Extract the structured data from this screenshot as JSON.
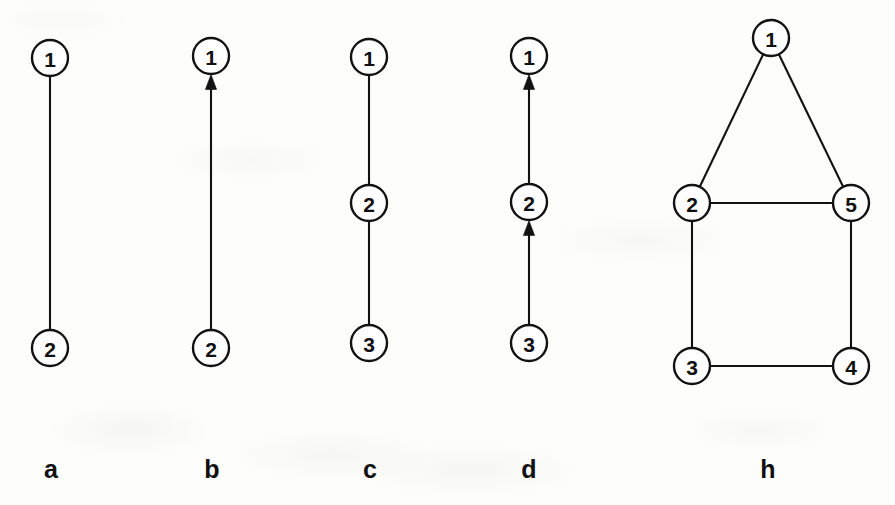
{
  "figure": {
    "width": 895,
    "height": 505,
    "background_color": "#fdfdfc",
    "ink_color": "#121212",
    "node_radius": 18,
    "node_fill": "#ffffff",
    "caption_y": 478
  },
  "panels": [
    {
      "id": "a",
      "caption": "a",
      "caption_x": 51,
      "directed": false,
      "nodes": [
        {
          "id": "a1",
          "label": "1",
          "cx": 50,
          "cy": 58
        },
        {
          "id": "a2",
          "label": "2",
          "cx": 50,
          "cy": 348
        }
      ],
      "edges": [
        {
          "from": "a1",
          "to": "a2",
          "arrow": false
        }
      ]
    },
    {
      "id": "b",
      "caption": "b",
      "caption_x": 212,
      "directed": true,
      "nodes": [
        {
          "id": "b1",
          "label": "1",
          "cx": 211,
          "cy": 56
        },
        {
          "id": "b2",
          "label": "2",
          "cx": 211,
          "cy": 348
        }
      ],
      "edges": [
        {
          "from": "b2",
          "to": "b1",
          "arrow": true
        }
      ]
    },
    {
      "id": "c",
      "caption": "c",
      "caption_x": 370,
      "directed": false,
      "nodes": [
        {
          "id": "c1",
          "label": "1",
          "cx": 369,
          "cy": 57
        },
        {
          "id": "c2",
          "label": "2",
          "cx": 369,
          "cy": 203
        },
        {
          "id": "c3",
          "label": "3",
          "cx": 369,
          "cy": 343
        }
      ],
      "edges": [
        {
          "from": "c1",
          "to": "c2",
          "arrow": false
        },
        {
          "from": "c2",
          "to": "c3",
          "arrow": false
        }
      ]
    },
    {
      "id": "d",
      "caption": "d",
      "caption_x": 529,
      "directed": true,
      "nodes": [
        {
          "id": "d1",
          "label": "1",
          "cx": 529,
          "cy": 56
        },
        {
          "id": "d2",
          "label": "2",
          "cx": 529,
          "cy": 202
        },
        {
          "id": "d3",
          "label": "3",
          "cx": 529,
          "cy": 343
        }
      ],
      "edges": [
        {
          "from": "d2",
          "to": "d1",
          "arrow": true
        },
        {
          "from": "d3",
          "to": "d2",
          "arrow": true
        }
      ]
    },
    {
      "id": "h",
      "caption": "h",
      "caption_x": 768,
      "directed": false,
      "nodes": [
        {
          "id": "h1",
          "label": "1",
          "cx": 771,
          "cy": 38
        },
        {
          "id": "h2",
          "label": "2",
          "cx": 692,
          "cy": 203
        },
        {
          "id": "h5",
          "label": "5",
          "cx": 851,
          "cy": 203
        },
        {
          "id": "h3",
          "label": "3",
          "cx": 692,
          "cy": 366
        },
        {
          "id": "h4",
          "label": "4",
          "cx": 851,
          "cy": 366
        }
      ],
      "edges": [
        {
          "from": "h1",
          "to": "h2",
          "arrow": false
        },
        {
          "from": "h1",
          "to": "h5",
          "arrow": false
        },
        {
          "from": "h2",
          "to": "h5",
          "arrow": false
        },
        {
          "from": "h2",
          "to": "h3",
          "arrow": false
        },
        {
          "from": "h5",
          "to": "h4",
          "arrow": false
        },
        {
          "from": "h3",
          "to": "h4",
          "arrow": false
        }
      ]
    }
  ]
}
